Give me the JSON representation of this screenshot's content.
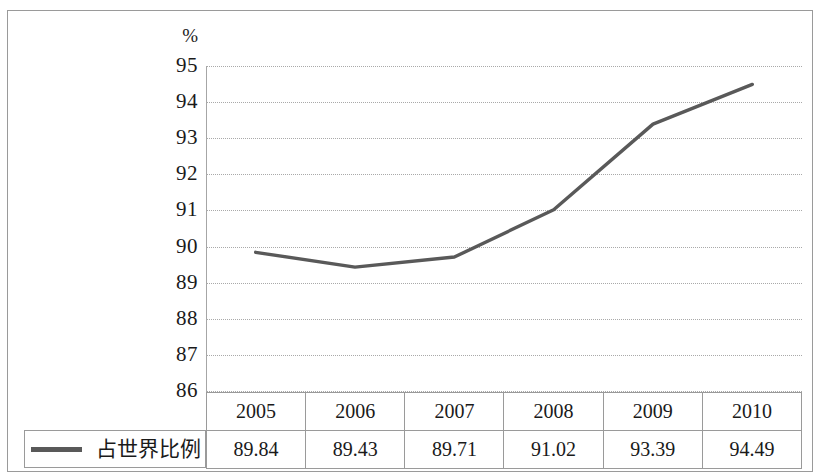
{
  "chart_data": {
    "type": "line",
    "title": "",
    "subtitle": "",
    "xlabel": "",
    "ylabel": "%",
    "unit_label": "%",
    "categories": [
      "2005",
      "2006",
      "2007",
      "2008",
      "2009",
      "2010"
    ],
    "series": [
      {
        "name": "占世界比例",
        "values": [
          89.84,
          89.43,
          89.71,
          91.02,
          93.39,
          94.49
        ],
        "color": "#595959"
      }
    ],
    "ylim": [
      86,
      95
    ],
    "yticks": [
      95,
      94,
      93,
      92,
      91,
      90,
      89,
      88,
      87,
      86
    ],
    "ytick_labels": [
      "95",
      "94",
      "93",
      "92",
      "91",
      "90",
      "89",
      "88",
      "87",
      "86"
    ],
    "grid": true,
    "grid_style": "dotted",
    "legend_position": "bottom-left",
    "has_data_table": true
  },
  "table": {
    "header_row": [
      "2005",
      "2006",
      "2007",
      "2008",
      "2009",
      "2010"
    ],
    "value_row": [
      "89.84",
      "89.43",
      "89.71",
      "91.02",
      "93.39",
      "94.49"
    ]
  },
  "legend": {
    "label": "占世界比例",
    "swatch_color": "#595959"
  },
  "colors": {
    "line": "#595959",
    "grid": "#a9a9a9",
    "axis": "#a6a6a6",
    "border": "#9a9a9a",
    "text": "#1a1a1a"
  }
}
